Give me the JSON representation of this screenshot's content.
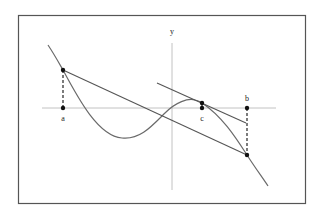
{
  "diagram": {
    "labels": {
      "y_axis": "y",
      "a": "a",
      "b": "b",
      "c": "c"
    },
    "colors": {
      "frame": "#555555",
      "axes": "#bbbbbb",
      "curve": "#6a6a6a",
      "lines": "#555555",
      "points": "#111111",
      "background": "#ffffff"
    },
    "elements": [
      "function curve",
      "secant line through (a, f(a)) and (b, f(b))",
      "tangent line at c parallel to secant",
      "dashed vertical segments from a and b to the curve"
    ]
  }
}
